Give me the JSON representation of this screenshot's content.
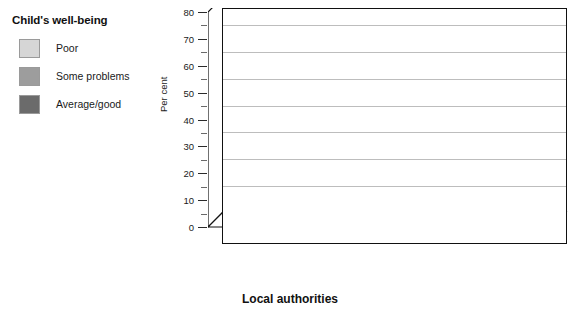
{
  "legend": {
    "title": "Child's well-being",
    "items": [
      {
        "label": "Poor",
        "color": "#d6d6d6"
      },
      {
        "label": "Some problems",
        "color": "#9d9d9d"
      },
      {
        "label": "Average/good",
        "color": "#6b6b6b"
      }
    ]
  },
  "axis": {
    "y_title": "Per cent",
    "x_title": "Local authorities",
    "y_ticks": [
      "0",
      "10",
      "20",
      "30",
      "40",
      "50",
      "60",
      "70",
      "80"
    ]
  },
  "categories": [
    {
      "name": "Coastshire",
      "n": "(n=25)"
    },
    {
      "name": "Fieldshire",
      "n": "(n=17)"
    },
    {
      "name": "Hillborough",
      "n": "(n=46)"
    },
    {
      "name": "Woodborough",
      "n": "(n=12)"
    }
  ],
  "chart_data": {
    "type": "bar",
    "title": "Child's well-being",
    "xlabel": "Local authorities",
    "ylabel": "Per cent",
    "ylim": [
      0,
      80
    ],
    "ytick_step": 10,
    "grid": true,
    "legend_position": "top-left-outside",
    "style": "3d-grouped-column",
    "categories": [
      "Coastshire",
      "Fieldshire",
      "Hillborough",
      "Woodborough"
    ],
    "category_sample_sizes": [
      "(n=25)",
      "(n=17)",
      "(n=46)",
      "(n=12)"
    ],
    "series": [
      {
        "name": "Poor",
        "color": "#d6d6d6",
        "values": [
          8,
          12,
          17,
          25
        ]
      },
      {
        "name": "Some problems",
        "color": "#9d9d9d",
        "values": [
          56,
          71,
          46,
          67
        ]
      },
      {
        "name": "Average/good",
        "color": "#6b6b6b",
        "values": [
          36,
          18,
          37,
          8
        ]
      }
    ],
    "data_labels": [
      {
        "category": "Coastshire",
        "Poor": 8,
        "Some problems": 56,
        "Average/good": 36
      },
      {
        "category": "Fieldshire",
        "Poor": 12,
        "Some problems": 71,
        "Average/good": 18
      },
      {
        "category": "Hillborough",
        "Poor": 17,
        "Some problems": 46,
        "Average/good": 37
      },
      {
        "category": "Woodborough",
        "Poor": 25,
        "Some problems": 67,
        "Average/good": 8
      }
    ]
  }
}
